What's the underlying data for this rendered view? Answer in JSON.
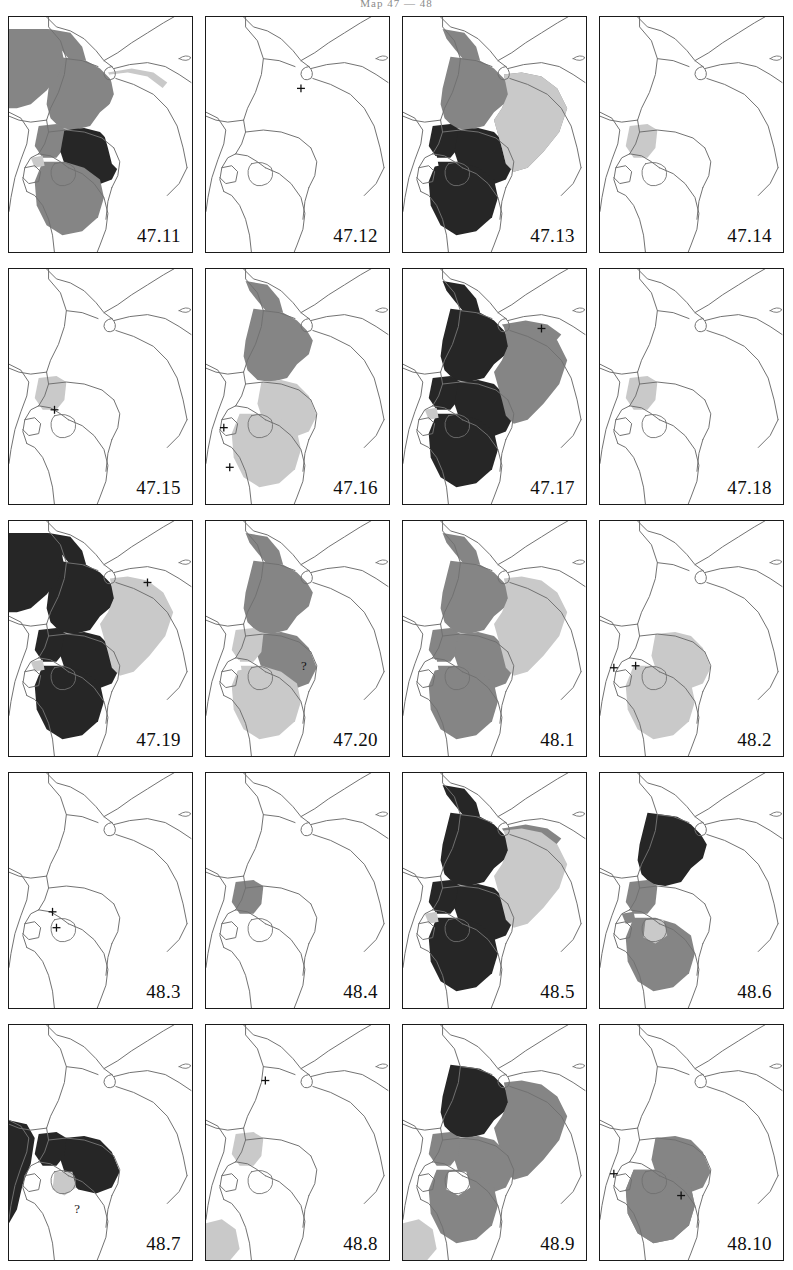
{
  "page": {
    "header_text": "Map 47 — 48"
  },
  "legend": {
    "colors": {
      "dark": "#262626",
      "medium": "#858585",
      "light": "#c9c9c9",
      "white": "#ffffff",
      "outline": "#707070",
      "frame": "#1a1a1a"
    },
    "shade_meanings": {
      "dark": "primary-distribution",
      "medium": "secondary-distribution",
      "light": "marginal-distribution",
      "white": "absent"
    }
  },
  "grid": {
    "columns": 4,
    "rows": 5,
    "panel_count": 20
  },
  "panels": [
    {
      "id": "p-47-11",
      "label": "47.11",
      "row": 1,
      "col": 1,
      "markers": [],
      "question_marks": [],
      "regions": [
        {
          "name": "ethiopia",
          "shade": "medium"
        },
        {
          "name": "eritrea",
          "shade": "medium"
        },
        {
          "name": "sudan-east",
          "shade": "medium"
        },
        {
          "name": "uganda",
          "shade": "medium"
        },
        {
          "name": "kenya",
          "shade": "dark"
        },
        {
          "name": "tanzania",
          "shade": "medium"
        },
        {
          "name": "somalia-north",
          "shade": "light"
        },
        {
          "name": "somalia",
          "shade": "white"
        },
        {
          "name": "rwanda-burundi",
          "shade": "light"
        }
      ]
    },
    {
      "id": "p-47-12",
      "label": "47.12",
      "row": 1,
      "col": 2,
      "markers": [
        {
          "type": "cross",
          "x": 96,
          "y": 72
        }
      ],
      "question_marks": [],
      "regions": [
        {
          "name": "eritrea-coast",
          "shade": "dark"
        }
      ]
    },
    {
      "id": "p-47-13",
      "label": "47.13",
      "row": 1,
      "col": 3,
      "markers": [],
      "question_marks": [],
      "regions": [
        {
          "name": "ethiopia",
          "shade": "medium"
        },
        {
          "name": "eritrea",
          "shade": "medium"
        },
        {
          "name": "uganda",
          "shade": "dark"
        },
        {
          "name": "kenya",
          "shade": "dark"
        },
        {
          "name": "tanzania",
          "shade": "dark"
        },
        {
          "name": "somalia-south",
          "shade": "medium"
        },
        {
          "name": "coast-strip",
          "shade": "light"
        },
        {
          "name": "rwanda-burundi",
          "shade": "white"
        }
      ]
    },
    {
      "id": "p-47-14",
      "label": "47.14",
      "row": 1,
      "col": 4,
      "markers": [],
      "question_marks": [],
      "regions": [
        {
          "name": "uganda-small",
          "shade": "light"
        }
      ]
    },
    {
      "id": "p-47-15",
      "label": "47.15",
      "row": 2,
      "col": 1,
      "markers": [
        {
          "type": "cross",
          "x": 46,
          "y": 142
        }
      ],
      "question_marks": [],
      "regions": [
        {
          "name": "uganda-west",
          "shade": "light"
        }
      ]
    },
    {
      "id": "p-47-16",
      "label": "47.16",
      "row": 2,
      "col": 2,
      "markers": [
        {
          "type": "cross",
          "x": 18,
          "y": 160
        },
        {
          "type": "cross",
          "x": 24,
          "y": 200
        }
      ],
      "question_marks": [],
      "regions": [
        {
          "name": "ethiopia",
          "shade": "medium"
        },
        {
          "name": "eritrea",
          "shade": "medium"
        },
        {
          "name": "kenya-coast",
          "shade": "light"
        },
        {
          "name": "tanzania-north",
          "shade": "light"
        }
      ]
    },
    {
      "id": "p-47-17",
      "label": "47.17",
      "row": 2,
      "col": 3,
      "markers": [
        {
          "type": "cross",
          "x": 140,
          "y": 60
        }
      ],
      "question_marks": [],
      "regions": [
        {
          "name": "ethiopia",
          "shade": "dark"
        },
        {
          "name": "eritrea",
          "shade": "dark"
        },
        {
          "name": "somalia-north",
          "shade": "medium"
        },
        {
          "name": "uganda",
          "shade": "dark"
        },
        {
          "name": "kenya",
          "shade": "dark"
        },
        {
          "name": "tanzania",
          "shade": "dark"
        },
        {
          "name": "coast-strip",
          "shade": "medium"
        },
        {
          "name": "rwanda-burundi",
          "shade": "light"
        }
      ]
    },
    {
      "id": "p-47-18",
      "label": "47.18",
      "row": 2,
      "col": 4,
      "markers": [],
      "question_marks": [],
      "regions": [
        {
          "name": "uganda",
          "shade": "light"
        }
      ]
    },
    {
      "id": "p-47-19",
      "label": "47.19",
      "row": 3,
      "col": 1,
      "markers": [
        {
          "type": "cross",
          "x": 140,
          "y": 62
        }
      ],
      "question_marks": [],
      "regions": [
        {
          "name": "ethiopia",
          "shade": "dark"
        },
        {
          "name": "eritrea",
          "shade": "dark"
        },
        {
          "name": "sudan-east",
          "shade": "dark"
        },
        {
          "name": "uganda",
          "shade": "dark"
        },
        {
          "name": "kenya",
          "shade": "dark"
        },
        {
          "name": "tanzania",
          "shade": "dark"
        },
        {
          "name": "somalia",
          "shade": "light"
        },
        {
          "name": "rwanda-burundi",
          "shade": "light"
        }
      ]
    },
    {
      "id": "p-47-20",
      "label": "47.20",
      "row": 3,
      "col": 2,
      "markers": [],
      "question_marks": [
        {
          "x": 96,
          "y": 150
        }
      ],
      "regions": [
        {
          "name": "ethiopia",
          "shade": "medium"
        },
        {
          "name": "eritrea",
          "shade": "medium"
        },
        {
          "name": "kenya-central",
          "shade": "medium"
        },
        {
          "name": "uganda",
          "shade": "light"
        },
        {
          "name": "tanzania",
          "shade": "light"
        },
        {
          "name": "rwanda-burundi",
          "shade": "white"
        }
      ]
    },
    {
      "id": "p-48-1",
      "label": "48.1",
      "row": 3,
      "col": 3,
      "markers": [],
      "question_marks": [],
      "regions": [
        {
          "name": "ethiopia",
          "shade": "medium"
        },
        {
          "name": "eritrea",
          "shade": "medium"
        },
        {
          "name": "uganda",
          "shade": "medium"
        },
        {
          "name": "kenya",
          "shade": "medium"
        },
        {
          "name": "tanzania",
          "shade": "medium"
        },
        {
          "name": "coast-strip",
          "shade": "light"
        },
        {
          "name": "rwanda-burundi",
          "shade": "white"
        }
      ]
    },
    {
      "id": "p-48-2",
      "label": "48.2",
      "row": 3,
      "col": 4,
      "markers": [
        {
          "type": "cross",
          "x": 14,
          "y": 148
        },
        {
          "type": "cross",
          "x": 36,
          "y": 146
        }
      ],
      "question_marks": [],
      "regions": [
        {
          "name": "kenya-blob",
          "shade": "light"
        },
        {
          "name": "tanzania-blob",
          "shade": "light"
        }
      ]
    },
    {
      "id": "p-48-3",
      "label": "48.3",
      "row": 4,
      "col": 1,
      "markers": [
        {
          "type": "cross",
          "x": 44,
          "y": 140
        },
        {
          "type": "cross",
          "x": 48,
          "y": 156
        }
      ],
      "question_marks": [],
      "regions": []
    },
    {
      "id": "p-48-4",
      "label": "48.4",
      "row": 4,
      "col": 2,
      "markers": [],
      "question_marks": [],
      "regions": [
        {
          "name": "uganda-small",
          "shade": "medium"
        }
      ]
    },
    {
      "id": "p-48-5",
      "label": "48.5",
      "row": 4,
      "col": 3,
      "markers": [],
      "question_marks": [],
      "regions": [
        {
          "name": "ethiopia",
          "shade": "dark"
        },
        {
          "name": "eritrea",
          "shade": "dark"
        },
        {
          "name": "somalia-north",
          "shade": "medium"
        },
        {
          "name": "uganda",
          "shade": "dark"
        },
        {
          "name": "kenya",
          "shade": "dark"
        },
        {
          "name": "tanzania",
          "shade": "dark"
        },
        {
          "name": "coast-strip",
          "shade": "light"
        },
        {
          "name": "rwanda-burundi",
          "shade": "light"
        }
      ]
    },
    {
      "id": "p-48-6",
      "label": "48.6",
      "row": 4,
      "col": 4,
      "markers": [],
      "question_marks": [],
      "regions": [
        {
          "name": "ethiopia",
          "shade": "dark"
        },
        {
          "name": "uganda",
          "shade": "medium"
        },
        {
          "name": "rwanda-burundi",
          "shade": "medium"
        },
        {
          "name": "tanzania-west",
          "shade": "medium"
        },
        {
          "name": "lake-area",
          "shade": "light"
        }
      ]
    },
    {
      "id": "p-48-7",
      "label": "48.7",
      "row": 5,
      "col": 1,
      "markers": [],
      "question_marks": [
        {
          "x": 66,
          "y": 190
        }
      ],
      "regions": [
        {
          "name": "kenya-west",
          "shade": "dark"
        },
        {
          "name": "uganda-east",
          "shade": "dark"
        },
        {
          "name": "lake-victoria",
          "shade": "light"
        },
        {
          "name": "congo-strip",
          "shade": "dark"
        }
      ]
    },
    {
      "id": "p-48-8",
      "label": "48.8",
      "row": 5,
      "col": 2,
      "markers": [
        {
          "type": "cross",
          "x": 60,
          "y": 56
        }
      ],
      "question_marks": [],
      "regions": [
        {
          "name": "uganda",
          "shade": "light"
        },
        {
          "name": "tanzania-south",
          "shade": "light"
        }
      ]
    },
    {
      "id": "p-48-9",
      "label": "48.9",
      "row": 5,
      "col": 3,
      "markers": [],
      "question_marks": [],
      "regions": [
        {
          "name": "ethiopia",
          "shade": "dark"
        },
        {
          "name": "somalia-south",
          "shade": "medium"
        },
        {
          "name": "kenya",
          "shade": "medium"
        },
        {
          "name": "uganda",
          "shade": "medium"
        },
        {
          "name": "tanzania",
          "shade": "medium"
        },
        {
          "name": "lake-victoria",
          "shade": "white"
        },
        {
          "name": "south-strip",
          "shade": "light"
        }
      ]
    },
    {
      "id": "p-48-10",
      "label": "48.10",
      "row": 5,
      "col": 4,
      "markers": [
        {
          "type": "cross",
          "x": 14,
          "y": 150
        },
        {
          "type": "cross",
          "x": 82,
          "y": 172
        }
      ],
      "question_marks": [],
      "regions": [
        {
          "name": "kenya-blob",
          "shade": "medium"
        },
        {
          "name": "tanzania-blob-west",
          "shade": "medium"
        },
        {
          "name": "tanzania-blob-east",
          "shade": "medium"
        }
      ]
    }
  ]
}
